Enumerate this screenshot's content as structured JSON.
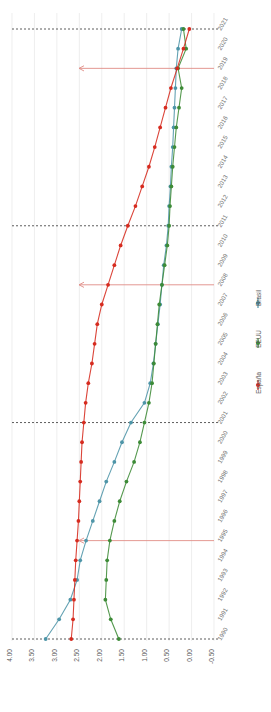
{
  "chart_data": {
    "type": "line",
    "orientation": "rotated-90",
    "title": "",
    "xlabel": "",
    "ylabel": "",
    "grid": true,
    "legend_position": "right",
    "value_axis": {
      "ticks": [
        "4.00",
        "3.50",
        "3.00",
        "2.50",
        "2.00",
        "1.50",
        "1.00",
        "0.50",
        "0.00",
        "-0.50"
      ],
      "values": [
        4.0,
        3.5,
        3.0,
        2.5,
        2.0,
        1.5,
        1.0,
        0.5,
        0.0,
        -0.5
      ],
      "lim": [
        -0.5,
        4.0
      ]
    },
    "categories": [
      "2021",
      "2020",
      "2019",
      "2018",
      "2017",
      "2016",
      "2015",
      "2014",
      "2013",
      "2012",
      "2011",
      "2010",
      "2009",
      "2008",
      "2007",
      "2006",
      "2005",
      "2004",
      "2003",
      "2002",
      "2001",
      "2000",
      "1999",
      "1998",
      "1997",
      "1996",
      "1995",
      "1994",
      "1993",
      "1992",
      "1991",
      "1990"
    ],
    "series": [
      {
        "name": "Brasil",
        "color": "#4e95a8",
        "marker": "circle",
        "values": [
          0.22,
          0.3,
          0.34,
          0.36,
          0.38,
          0.4,
          0.42,
          0.45,
          0.47,
          0.5,
          0.52,
          0.56,
          0.62,
          0.66,
          0.7,
          0.75,
          0.8,
          0.85,
          0.92,
          1.05,
          1.35,
          1.55,
          1.72,
          1.9,
          2.05,
          2.2,
          2.35,
          2.48,
          2.55,
          2.7,
          2.95,
          3.25
        ]
      },
      {
        "name": "EEUU",
        "color": "#3d8b37",
        "marker": "circle",
        "values": [
          0.18,
          0.12,
          0.3,
          0.22,
          0.28,
          0.34,
          0.38,
          0.42,
          0.45,
          0.48,
          0.5,
          0.54,
          0.6,
          0.66,
          0.72,
          0.76,
          0.8,
          0.84,
          0.88,
          0.95,
          1.05,
          1.15,
          1.28,
          1.45,
          1.6,
          1.72,
          1.82,
          1.88,
          1.9,
          1.92,
          1.8,
          1.62
        ]
      },
      {
        "name": "España",
        "color": "#d62b1f",
        "marker": "circle",
        "values": [
          0.05,
          0.18,
          0.32,
          0.46,
          0.58,
          0.7,
          0.82,
          0.95,
          1.1,
          1.25,
          1.42,
          1.58,
          1.72,
          1.86,
          2.0,
          2.1,
          2.16,
          2.22,
          2.3,
          2.36,
          2.4,
          2.44,
          2.46,
          2.48,
          2.5,
          2.52,
          2.55,
          2.58,
          2.6,
          2.62,
          2.64,
          2.68
        ]
      }
    ],
    "dashed_reference_lines": [
      {
        "category": "2021",
        "style": "dashed"
      },
      {
        "category": "2011",
        "style": "dashed"
      },
      {
        "category": "2001",
        "style": "dashed"
      },
      {
        "category": "1990",
        "style": "dashed"
      }
    ],
    "annotation_arrows": [
      {
        "category": "2019",
        "direction": "left",
        "color": "#e08c86"
      },
      {
        "category": "2008",
        "direction": "left",
        "color": "#e08c86"
      },
      {
        "category": "1995",
        "direction": "left",
        "color": "#e08c86"
      }
    ]
  },
  "legend": {
    "items": [
      {
        "label": "Brasil",
        "color": "#4e95a8"
      },
      {
        "label": "EEUU",
        "color": "#3d8b37"
      },
      {
        "label": "España",
        "color": "#d62b1f"
      }
    ]
  }
}
